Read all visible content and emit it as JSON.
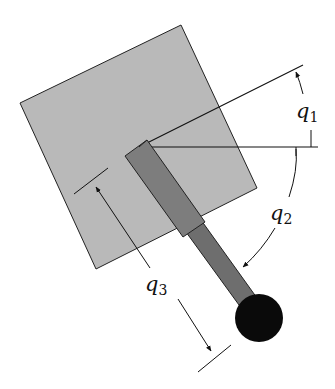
{
  "diagram": {
    "type": "robot-arm-joint-variables",
    "labels": {
      "q1": {
        "base": "q",
        "sub": "1"
      },
      "q2": {
        "base": "q",
        "sub": "2"
      },
      "q3": {
        "base": "q",
        "sub": "3"
      }
    },
    "colors": {
      "base_square": "#b9b9b9",
      "outer_link": "#7a7a7a",
      "inner_link": "#6e6e6e",
      "end_effector": "#0a0a0a",
      "lines": "#111111"
    }
  }
}
